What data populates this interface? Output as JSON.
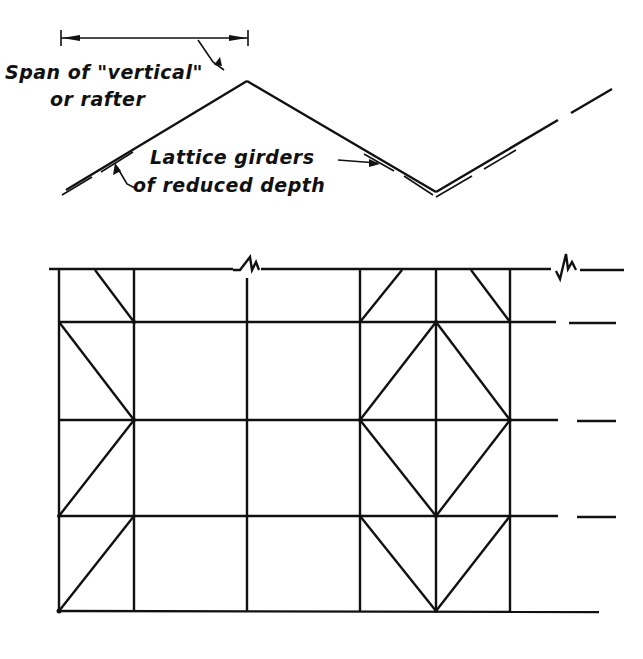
{
  "labels": {
    "span_line1": "Span of \"vertical\"",
    "span_line2": "or rafter",
    "lattice_line1": "Lattice girders",
    "lattice_line2": "of reduced depth"
  },
  "colors": {
    "ink": "#111111",
    "paper": "#ffffff"
  },
  "figure": {
    "upper": {
      "description": "Zig-zag (folded) roof section formed by lattice girders of reduced depth",
      "peak": [
        247,
        82
      ],
      "valley": [
        436,
        192
      ]
    },
    "lower": {
      "description": "Plan/elevation grid of lattice girders with diagonal bracing",
      "verticals_x": [
        59,
        134,
        247,
        360,
        435,
        510
      ],
      "horizontals_y": [
        270,
        322,
        420,
        515,
        610
      ],
      "break_symbols": [
        "top-edge-mid",
        "top-edge-right"
      ]
    }
  }
}
